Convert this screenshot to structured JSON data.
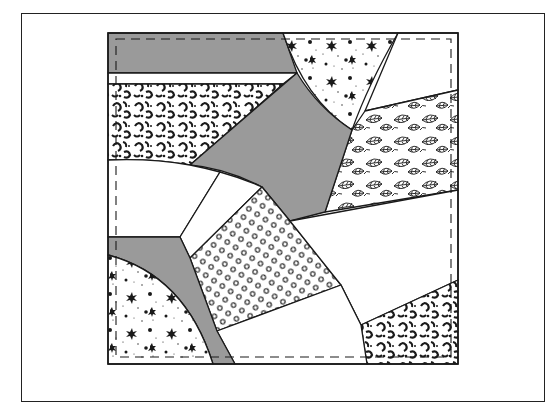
{
  "figure": {
    "title": "Crazy quilt block",
    "colors": {
      "background": "#ffffff",
      "frame_line": "#222222",
      "outline": "#1a1a1a",
      "solid_gray_fabric": "#9a9a9a",
      "white_fabric": "#ffffff",
      "print_ink": "#1a1a1a"
    },
    "frame": {
      "x": 21,
      "y": 13,
      "width": 524,
      "height": 389
    },
    "block": {
      "x": 108,
      "y": 33,
      "width": 350,
      "height": 331
    },
    "seam_line": {
      "x": 116,
      "y": 39,
      "width": 335,
      "height": 318,
      "style": "dashed"
    },
    "patches": [
      {
        "id": "gray-top-band",
        "fabric": "solid-gray"
      },
      {
        "id": "white-top-strip",
        "fabric": "plain-white"
      },
      {
        "id": "floral-print-left",
        "fabric": "dark-floral-print"
      },
      {
        "id": "speckled-wedge-top",
        "fabric": "speckled-print"
      },
      {
        "id": "white-top-right",
        "fabric": "plain-white"
      },
      {
        "id": "leaf-print-right",
        "fabric": "leaf-print"
      },
      {
        "id": "gray-center",
        "fabric": "solid-gray"
      },
      {
        "id": "white-left-middle",
        "fabric": "plain-white"
      },
      {
        "id": "white-narrow-diagonal",
        "fabric": "plain-white"
      },
      {
        "id": "polka-dot-center",
        "fabric": "ring-dot-print"
      },
      {
        "id": "white-right-middle",
        "fabric": "plain-white"
      },
      {
        "id": "floral-print-bottom-right",
        "fabric": "dark-floral-print"
      },
      {
        "id": "white-bottom-center",
        "fabric": "plain-white"
      },
      {
        "id": "gray-lower-left-band",
        "fabric": "solid-gray"
      },
      {
        "id": "speckled-quarter-bottom-left",
        "fabric": "speckled-print"
      }
    ]
  }
}
